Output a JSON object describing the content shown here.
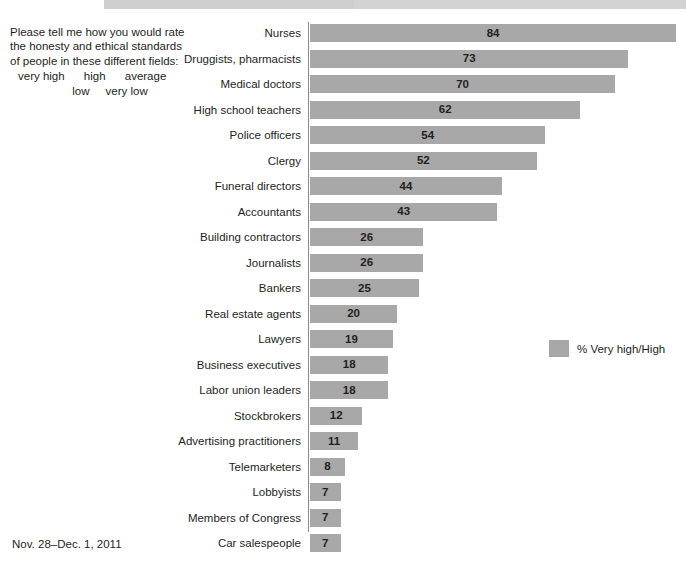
{
  "question": {
    "text": "Please tell me how you would rate the honesty and ethical standards of people in these different fields:",
    "scale_line_1": "very high      high      average",
    "scale_line_2": "low     very low"
  },
  "date_note": "Nov. 28–Dec. 1, 2011",
  "legend": {
    "label": "% Very high/High",
    "swatch_color": "#a8a8a8"
  },
  "colors": {
    "bar": "#a8a8a8",
    "axis": "#8c8c8c",
    "text": "#231f20",
    "top_band": "#d3d3d3"
  },
  "chart_data": {
    "type": "bar",
    "orientation": "horizontal",
    "title": "",
    "subtitle": "",
    "xlabel": "",
    "ylabel": "",
    "xlim": [
      0,
      100
    ],
    "grid": false,
    "legend_position": "right",
    "value_labels": true,
    "series_name": "% Very high/High",
    "categories": [
      "Nurses",
      "Druggists, pharmacists",
      "Medical doctors",
      "High school teachers",
      "Police officers",
      "Clergy",
      "Funeral directors",
      "Accountants",
      "Building contractors",
      "Journalists",
      "Bankers",
      "Real estate agents",
      "Lawyers",
      "Business executives",
      "Labor union leaders",
      "Stockbrokers",
      "Advertising practitioners",
      "Telemarketers",
      "Lobbyists",
      "Members of Congress",
      "Car salespeople"
    ],
    "values": [
      84,
      73,
      70,
      62,
      54,
      52,
      44,
      43,
      26,
      26,
      25,
      20,
      19,
      18,
      18,
      12,
      11,
      8,
      7,
      7,
      7
    ]
  }
}
